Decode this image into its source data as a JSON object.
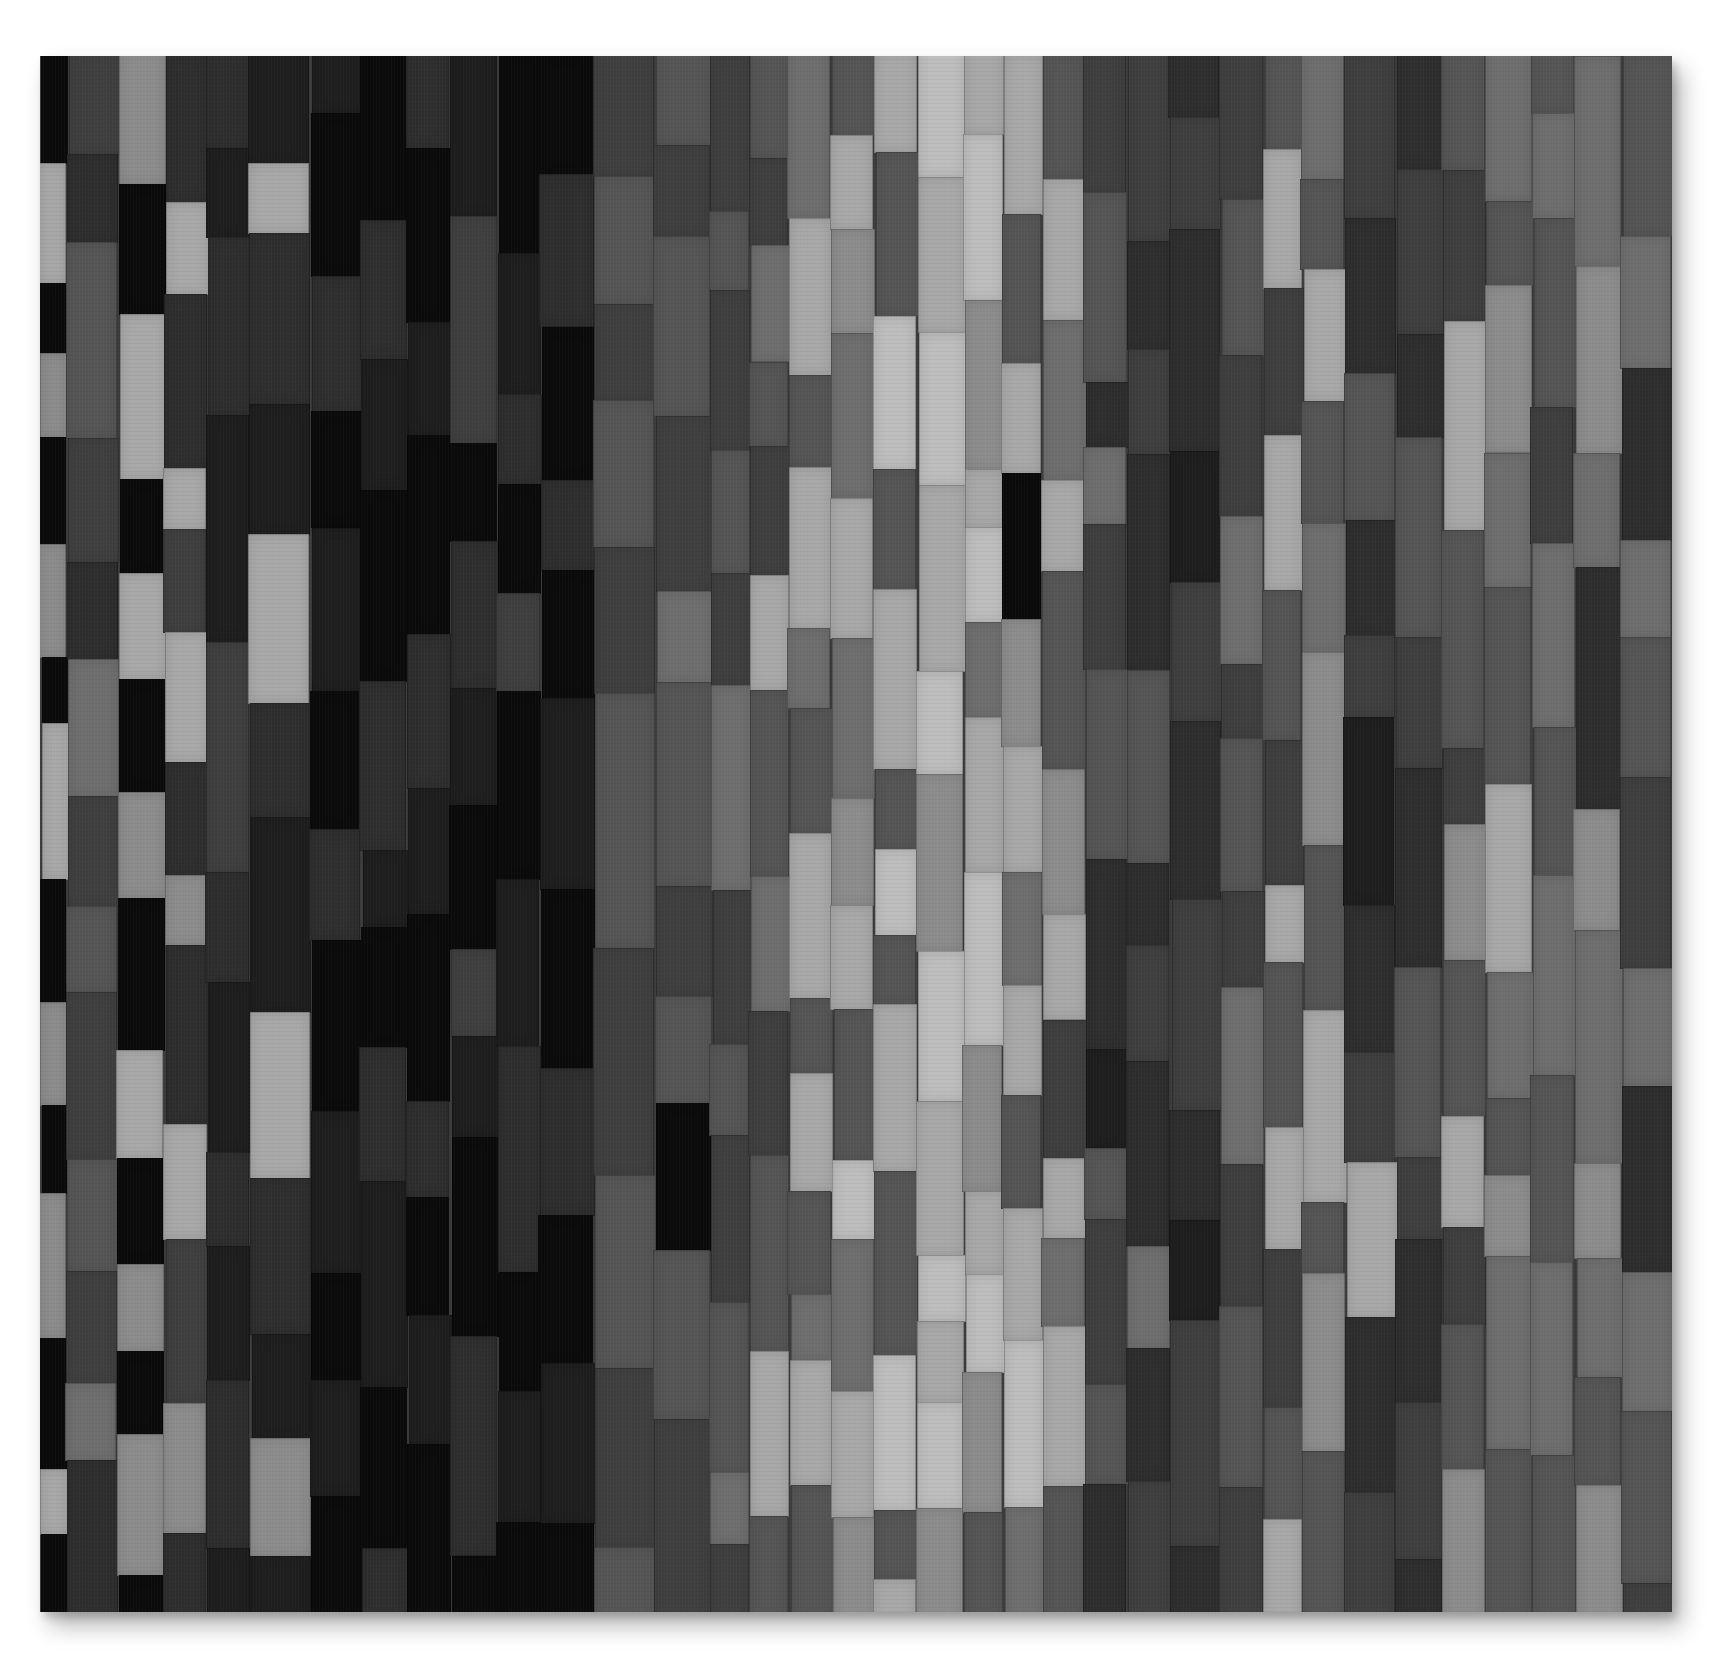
{
  "artwork": {
    "subject": "grayscale strip-pieced quilt",
    "background_color": "#ffffff",
    "bounds": {
      "left": 40,
      "top": 56,
      "width": 1632,
      "height": 1556
    },
    "palette": {
      "black": "#0b0b0b",
      "very_dark": "#1e1e1e",
      "dark": "#2e2e2e",
      "dark_mid": "#3f3f3f",
      "mid": "#555555",
      "mid_light": "#6e6e6e",
      "light": "#8c8c8c",
      "very_light": "#a8a8a8",
      "highlight": "#bdbdbd"
    },
    "strips": [
      {
        "w": 28,
        "tones": [
          "black",
          "very_light",
          "black",
          "light",
          "black",
          "light",
          "black",
          "very_light",
          "black",
          "light",
          "black",
          "light",
          "black",
          "very_light",
          "black"
        ]
      },
      {
        "w": 52,
        "tones": [
          "dark_mid",
          "dark",
          "mid",
          "dark_mid",
          "dark",
          "mid_light",
          "dark_mid",
          "mid",
          "dark_mid",
          "mid",
          "dark_mid",
          "mid_light",
          "dark"
        ]
      },
      {
        "w": 48,
        "tones": [
          "light",
          "black",
          "very_light",
          "black",
          "very_light",
          "black",
          "light",
          "black",
          "very_light",
          "black",
          "light",
          "black",
          "light",
          "black"
        ]
      },
      {
        "w": 44,
        "tones": [
          "dark",
          "very_light",
          "dark",
          "very_light",
          "dark_mid",
          "very_light",
          "dark",
          "light",
          "dark",
          "very_light",
          "dark_mid",
          "light",
          "dark"
        ]
      },
      {
        "w": 44,
        "tones": [
          "dark",
          "very_dark",
          "dark",
          "very_dark",
          "dark_mid",
          "dark",
          "very_dark",
          "dark",
          "very_dark",
          "dark",
          "very_dark"
        ]
      },
      {
        "w": 62,
        "tones": [
          "very_dark",
          "very_light",
          "dark",
          "very_dark",
          "very_light",
          "dark",
          "very_dark",
          "very_light",
          "dark",
          "very_dark",
          "light",
          "very_dark"
        ]
      },
      {
        "w": 52,
        "tones": [
          "very_dark",
          "black",
          "dark",
          "black",
          "very_dark",
          "black",
          "dark",
          "black",
          "very_dark",
          "black",
          "very_dark",
          "black"
        ]
      },
      {
        "w": 48,
        "tones": [
          "black",
          "dark",
          "very_dark",
          "black",
          "dark",
          "very_dark",
          "black",
          "dark",
          "very_dark",
          "black",
          "dark"
        ]
      },
      {
        "w": 44,
        "tones": [
          "dark",
          "black",
          "very_dark",
          "black",
          "dark",
          "very_dark",
          "black",
          "dark",
          "black",
          "very_dark",
          "black"
        ]
      },
      {
        "w": 48,
        "tones": [
          "very_dark",
          "dark_mid",
          "black",
          "dark",
          "very_dark",
          "black",
          "dark_mid",
          "very_dark",
          "black",
          "dark",
          "black"
        ]
      },
      {
        "w": 44,
        "tones": [
          "black",
          "very_dark",
          "dark",
          "black",
          "dark_mid",
          "black",
          "very_dark",
          "dark",
          "black",
          "very_dark",
          "black"
        ]
      },
      {
        "w": 56,
        "tones": [
          "black",
          "dark",
          "black",
          "dark",
          "black",
          "very_dark",
          "black",
          "dark",
          "black",
          "very_dark",
          "black"
        ]
      },
      {
        "w": 62,
        "tones": [
          "dark_mid",
          "mid",
          "dark_mid",
          "mid",
          "dark_mid",
          "mid",
          "dark_mid",
          "mid",
          "dark_mid",
          "mid"
        ]
      },
      {
        "w": 58,
        "tones": [
          "mid",
          "dark_mid",
          "mid",
          "dark_mid",
          "mid_light",
          "mid",
          "dark_mid",
          "mid",
          "black",
          "mid",
          "dark_mid"
        ]
      },
      {
        "w": 40,
        "tones": [
          "dark_mid",
          "mid",
          "dark_mid",
          "mid",
          "dark_mid",
          "mid_light",
          "dark_mid",
          "mid",
          "dark_mid",
          "mid",
          "mid_light",
          "dark_mid"
        ]
      },
      {
        "w": 40,
        "tones": [
          "mid",
          "dark_mid",
          "mid_light",
          "mid",
          "dark_mid",
          "very_light",
          "mid",
          "mid_light",
          "dark_mid",
          "mid",
          "very_light",
          "mid"
        ]
      },
      {
        "w": 44,
        "tones": [
          "mid_light",
          "very_light",
          "mid",
          "very_light",
          "mid_light",
          "mid",
          "very_light",
          "mid",
          "very_light",
          "mid",
          "mid_light",
          "very_light",
          "mid"
        ]
      },
      {
        "w": 44,
        "tones": [
          "mid",
          "very_light",
          "light",
          "mid_light",
          "very_light",
          "mid_light",
          "light",
          "very_light",
          "mid",
          "highlight",
          "mid_light",
          "very_light",
          "light"
        ]
      },
      {
        "w": 44,
        "tones": [
          "very_light",
          "mid",
          "highlight",
          "mid",
          "very_light",
          "mid",
          "highlight",
          "mid",
          "very_light",
          "mid",
          "highlight",
          "mid",
          "very_light"
        ]
      },
      {
        "w": 48,
        "tones": [
          "highlight",
          "very_light",
          "highlight",
          "very_light",
          "highlight",
          "light",
          "highlight",
          "very_light",
          "highlight",
          "very_light",
          "highlight",
          "light"
        ]
      },
      {
        "w": 40,
        "tones": [
          "very_light",
          "highlight",
          "light",
          "very_light",
          "highlight",
          "mid_light",
          "very_light",
          "highlight",
          "light",
          "very_light",
          "highlight",
          "light",
          "mid"
        ]
      },
      {
        "w": 40,
        "tones": [
          "very_light",
          "mid",
          "very_light",
          "black",
          "light",
          "very_light",
          "mid_light",
          "very_light",
          "mid",
          "very_light",
          "highlight",
          "mid_light"
        ]
      },
      {
        "w": 44,
        "tones": [
          "mid",
          "very_light",
          "mid_light",
          "very_light",
          "mid",
          "light",
          "very_light",
          "dark_mid",
          "very_light",
          "mid_light",
          "very_light",
          "mid"
        ]
      },
      {
        "w": 44,
        "tones": [
          "dark_mid",
          "mid",
          "dark",
          "mid_light",
          "dark_mid",
          "mid",
          "dark",
          "very_dark",
          "mid",
          "dark_mid",
          "mid",
          "dark"
        ]
      },
      {
        "w": 44,
        "tones": [
          "dark_mid",
          "dark",
          "dark_mid",
          "dark",
          "mid",
          "dark",
          "dark_mid",
          "dark",
          "mid_light",
          "dark",
          "dark_mid"
        ]
      },
      {
        "w": 52,
        "tones": [
          "dark",
          "dark_mid",
          "dark",
          "very_dark",
          "dark_mid",
          "dark",
          "dark_mid",
          "dark",
          "very_dark",
          "dark_mid",
          "dark"
        ]
      },
      {
        "w": 44,
        "tones": [
          "dark_mid",
          "mid",
          "dark_mid",
          "mid_light",
          "dark_mid",
          "mid",
          "dark_mid",
          "mid_light",
          "dark_mid",
          "mid",
          "dark_mid"
        ]
      },
      {
        "w": 40,
        "tones": [
          "mid",
          "very_light",
          "dark_mid",
          "very_light",
          "mid",
          "dark_mid",
          "very_light",
          "mid",
          "very_light",
          "dark_mid",
          "mid",
          "very_light"
        ]
      },
      {
        "w": 44,
        "tones": [
          "mid_light",
          "mid",
          "very_light",
          "mid",
          "mid_light",
          "light",
          "mid",
          "very_light",
          "mid",
          "light",
          "mid"
        ]
      },
      {
        "w": 52,
        "tones": [
          "dark_mid",
          "dark",
          "mid",
          "dark",
          "dark_mid",
          "very_dark",
          "dark",
          "dark_mid",
          "very_light",
          "dark",
          "dark_mid"
        ]
      },
      {
        "w": 48,
        "tones": [
          "dark",
          "dark_mid",
          "dark",
          "mid",
          "dark_mid",
          "dark",
          "mid",
          "dark_mid",
          "dark",
          "dark_mid",
          "dark"
        ]
      },
      {
        "w": 44,
        "tones": [
          "mid",
          "dark_mid",
          "very_light",
          "mid",
          "dark_mid",
          "light",
          "mid",
          "very_light",
          "dark_mid",
          "mid",
          "light"
        ]
      },
      {
        "w": 48,
        "tones": [
          "mid_light",
          "mid",
          "light",
          "mid_light",
          "mid",
          "very_light",
          "mid_light",
          "mid",
          "light",
          "mid_light",
          "mid"
        ]
      },
      {
        "w": 44,
        "tones": [
          "mid",
          "mid_light",
          "mid",
          "dark_mid",
          "mid_light",
          "mid",
          "mid_light",
          "mid",
          "mid_light",
          "mid"
        ]
      },
      {
        "w": 48,
        "tones": [
          "mid_light",
          "light",
          "mid_light",
          "dark",
          "light",
          "mid_light",
          "light",
          "mid_light",
          "mid",
          "light"
        ]
      },
      {
        "w": 52,
        "tones": [
          "mid",
          "mid_light",
          "dark",
          "mid_light",
          "mid",
          "dark_mid",
          "mid_light",
          "dark",
          "mid_light",
          "mid",
          "dark_mid"
        ]
      }
    ]
  }
}
